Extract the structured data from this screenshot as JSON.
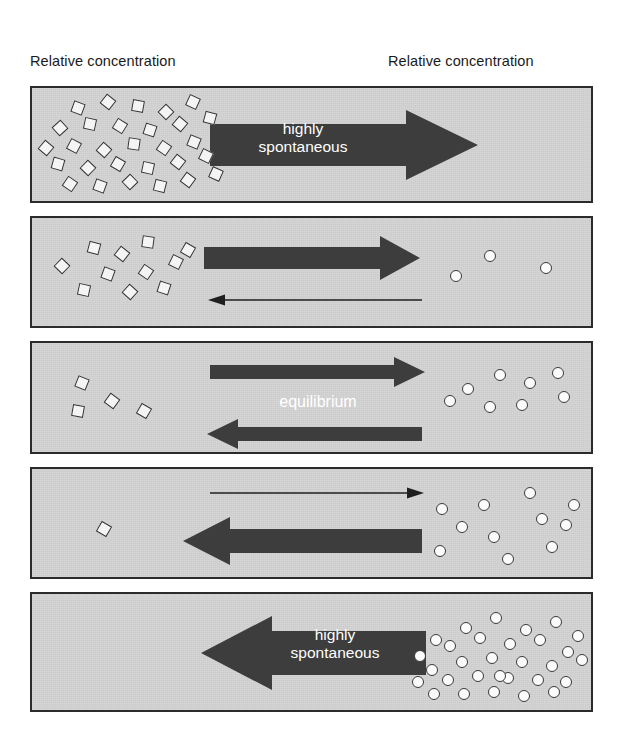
{
  "figure": {
    "headers": {
      "reactant": {
        "line1": "Relative concentration",
        "line2": "of reactant:"
      },
      "product": {
        "line1": "Relative concentration",
        "line2": "of product:"
      }
    },
    "colors": {
      "panel_background": "#d4d4d4",
      "panel_border": "#2b2b2b",
      "arrow_fill": "#3d3d3d",
      "arrow_label_text": "#ffffff",
      "molecule_fill": "#fbfbfb",
      "molecule_outline": "#3a3a3a",
      "header_text": "#1a1a1a"
    },
    "labels": {
      "highly_spontaneous": "highly\nspontaneous",
      "equilibrium": "equilibrium"
    }
  },
  "chart_data": {
    "type": "diagram",
    "xlabel": "",
    "ylabel": "",
    "legend": [
      "reactant (open diamond)",
      "product (open circle)"
    ],
    "categories": [
      "panel 1",
      "panel 2",
      "panel 3",
      "panel 4",
      "panel 5"
    ],
    "series": [
      {
        "name": "reactant count",
        "values": [
          29,
          11,
          4,
          1,
          0
        ]
      },
      {
        "name": "product count",
        "values": [
          0,
          3,
          8,
          11,
          30
        ]
      }
    ],
    "annotations": [
      "highly spontaneous (forward)",
      "equilibrium",
      "highly spontaneous (reverse)"
    ],
    "panels": [
      {
        "index": 1,
        "reactant_count": 29,
        "product_count": 0,
        "forward_arrow": "thick",
        "reverse_arrow": "none",
        "label": "highly\nspontaneous",
        "direction": "forward",
        "reactants": [
          {
            "x": 40,
            "y": 14,
            "rot": 20
          },
          {
            "x": 70,
            "y": 8,
            "rot": 38
          },
          {
            "x": 100,
            "y": 12,
            "rot": 10
          },
          {
            "x": 128,
            "y": 18,
            "rot": 45
          },
          {
            "x": 155,
            "y": 8,
            "rot": 25
          },
          {
            "x": 22,
            "y": 34,
            "rot": 48
          },
          {
            "x": 52,
            "y": 30,
            "rot": 12
          },
          {
            "x": 82,
            "y": 32,
            "rot": 32
          },
          {
            "x": 112,
            "y": 36,
            "rot": 18
          },
          {
            "x": 142,
            "y": 30,
            "rot": 40
          },
          {
            "x": 172,
            "y": 24,
            "rot": 15
          },
          {
            "x": 36,
            "y": 52,
            "rot": 28
          },
          {
            "x": 66,
            "y": 56,
            "rot": 42
          },
          {
            "x": 96,
            "y": 50,
            "rot": 8
          },
          {
            "x": 126,
            "y": 54,
            "rot": 35
          },
          {
            "x": 156,
            "y": 48,
            "rot": 22
          },
          {
            "x": 20,
            "y": 70,
            "rot": 16
          },
          {
            "x": 50,
            "y": 74,
            "rot": 44
          },
          {
            "x": 80,
            "y": 70,
            "rot": 30
          },
          {
            "x": 110,
            "y": 74,
            "rot": 12
          },
          {
            "x": 140,
            "y": 68,
            "rot": 38
          },
          {
            "x": 168,
            "y": 62,
            "rot": 26
          },
          {
            "x": 32,
            "y": 90,
            "rot": 34
          },
          {
            "x": 62,
            "y": 92,
            "rot": 20
          },
          {
            "x": 92,
            "y": 88,
            "rot": 46
          },
          {
            "x": 122,
            "y": 92,
            "rot": 14
          },
          {
            "x": 150,
            "y": 86,
            "rot": 36
          },
          {
            "x": 178,
            "y": 80,
            "rot": 24
          },
          {
            "x": 8,
            "y": 54,
            "rot": 40
          }
        ],
        "products": []
      },
      {
        "index": 2,
        "reactant_count": 11,
        "product_count": 3,
        "forward_arrow": "thick",
        "reverse_arrow": "thin",
        "label": "",
        "direction": "forward",
        "reactants": [
          {
            "x": 56,
            "y": 24,
            "rot": 15
          },
          {
            "x": 84,
            "y": 30,
            "rot": 38
          },
          {
            "x": 110,
            "y": 18,
            "rot": 8
          },
          {
            "x": 24,
            "y": 42,
            "rot": 44
          },
          {
            "x": 138,
            "y": 38,
            "rot": 26
          },
          {
            "x": 70,
            "y": 50,
            "rot": 20
          },
          {
            "x": 108,
            "y": 48,
            "rot": 34
          },
          {
            "x": 46,
            "y": 66,
            "rot": 12
          },
          {
            "x": 92,
            "y": 68,
            "rot": 42
          },
          {
            "x": 126,
            "y": 64,
            "rot": 18
          },
          {
            "x": 150,
            "y": 26,
            "rot": 30
          }
        ],
        "products": [
          {
            "x": 452,
            "y": 32
          },
          {
            "x": 418,
            "y": 52
          },
          {
            "x": 508,
            "y": 44
          }
        ]
      },
      {
        "index": 3,
        "reactant_count": 4,
        "product_count": 8,
        "forward_arrow": "medium",
        "reverse_arrow": "medium",
        "label": "equilibrium",
        "direction": "both",
        "reactants": [
          {
            "x": 44,
            "y": 34,
            "rot": 22
          },
          {
            "x": 74,
            "y": 52,
            "rot": 36
          },
          {
            "x": 40,
            "y": 62,
            "rot": 10
          },
          {
            "x": 106,
            "y": 62,
            "rot": 30
          }
        ],
        "products": [
          {
            "x": 430,
            "y": 40
          },
          {
            "x": 462,
            "y": 26
          },
          {
            "x": 492,
            "y": 34
          },
          {
            "x": 520,
            "y": 24
          },
          {
            "x": 452,
            "y": 58
          },
          {
            "x": 484,
            "y": 56
          },
          {
            "x": 526,
            "y": 48
          },
          {
            "x": 412,
            "y": 52
          }
        ]
      },
      {
        "index": 4,
        "reactant_count": 1,
        "product_count": 11,
        "forward_arrow": "thin",
        "reverse_arrow": "thick",
        "label": "",
        "direction": "reverse",
        "reactants": [
          {
            "x": 66,
            "y": 54,
            "rot": 30
          }
        ],
        "products": [
          {
            "x": 404,
            "y": 34
          },
          {
            "x": 446,
            "y": 30
          },
          {
            "x": 492,
            "y": 18
          },
          {
            "x": 424,
            "y": 52
          },
          {
            "x": 504,
            "y": 44
          },
          {
            "x": 528,
            "y": 50
          },
          {
            "x": 456,
            "y": 62
          },
          {
            "x": 402,
            "y": 76
          },
          {
            "x": 470,
            "y": 84
          },
          {
            "x": 514,
            "y": 72
          },
          {
            "x": 536,
            "y": 30
          }
        ]
      },
      {
        "index": 5,
        "reactant_count": 0,
        "product_count": 30,
        "forward_arrow": "none",
        "reverse_arrow": "thick",
        "label": "highly\nspontaneous",
        "direction": "reverse",
        "reactants": [],
        "products": [
          {
            "x": 398,
            "y": 40
          },
          {
            "x": 428,
            "y": 28
          },
          {
            "x": 458,
            "y": 18
          },
          {
            "x": 488,
            "y": 30
          },
          {
            "x": 518,
            "y": 22
          },
          {
            "x": 540,
            "y": 36
          },
          {
            "x": 382,
            "y": 56
          },
          {
            "x": 412,
            "y": 46
          },
          {
            "x": 442,
            "y": 38
          },
          {
            "x": 472,
            "y": 44
          },
          {
            "x": 502,
            "y": 40
          },
          {
            "x": 530,
            "y": 52
          },
          {
            "x": 394,
            "y": 70
          },
          {
            "x": 424,
            "y": 62
          },
          {
            "x": 454,
            "y": 58
          },
          {
            "x": 484,
            "y": 62
          },
          {
            "x": 514,
            "y": 66
          },
          {
            "x": 544,
            "y": 60
          },
          {
            "x": 380,
            "y": 82
          },
          {
            "x": 410,
            "y": 80
          },
          {
            "x": 440,
            "y": 76
          },
          {
            "x": 470,
            "y": 78
          },
          {
            "x": 500,
            "y": 80
          },
          {
            "x": 528,
            "y": 82
          },
          {
            "x": 396,
            "y": 94
          },
          {
            "x": 426,
            "y": 94
          },
          {
            "x": 456,
            "y": 92
          },
          {
            "x": 486,
            "y": 96
          },
          {
            "x": 516,
            "y": 92
          },
          {
            "x": 462,
            "y": 76
          }
        ]
      }
    ]
  }
}
